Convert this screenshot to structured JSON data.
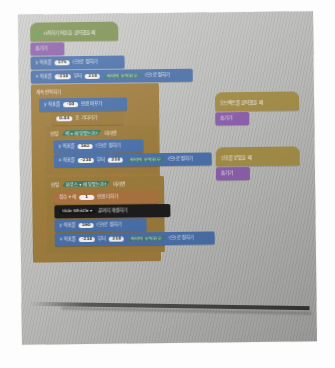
{
  "scene": {
    "description": "photo-of-screen",
    "app": "block-coding-editor",
    "colors": {
      "motion": "#4a6fa8",
      "look": "#8a5ea8",
      "event": "#a08a46",
      "control": "#9a7a3c",
      "sound": "#1d1d1d",
      "calc": "#4e8a72",
      "variable": "#a8713f",
      "start": "#7a8f4e",
      "screen_background": "#bdbdbb"
    }
  },
  "main_script": {
    "name": "main-stack",
    "blocks": [
      {
        "id": "b0",
        "kind": "hat",
        "category": "start",
        "icon": "green-flag-icon",
        "text": "시작하기 버튼을 클릭했을 때"
      },
      {
        "id": "b1",
        "kind": "stack",
        "category": "look",
        "text": "숨기기"
      },
      {
        "id": "b2",
        "kind": "stack",
        "category": "motion",
        "pre": "y 좌표를",
        "value": "175",
        "post": "(으)로 정하기"
      },
      {
        "id": "b3",
        "kind": "stack",
        "category": "motion",
        "pre": "x 좌표를",
        "value1": "-210",
        "mid": "부터",
        "value2": "210",
        "hex": "사이의 무작위 수",
        "post": "(으)로 정하기"
      },
      {
        "id": "b4",
        "kind": "c-head",
        "category": "control",
        "text": "계속 반복하기"
      },
      {
        "id": "b5",
        "kind": "stack",
        "category": "motion",
        "pre": "y 좌표를",
        "value": "-10",
        "post": "만큼 바꾸기"
      },
      {
        "id": "b6",
        "kind": "stack",
        "category": "control",
        "value": "0.03",
        "post": "초 기다리기"
      },
      {
        "id": "b7",
        "kind": "c-head",
        "category": "control",
        "pre": "만일",
        "hex": "벽 ▾ 에 닿았는가?",
        "post": "이라면"
      },
      {
        "id": "b8",
        "kind": "stack",
        "category": "motion",
        "pre": "y 좌표를",
        "value": "162",
        "post": "(으)로 정하기"
      },
      {
        "id": "b9",
        "kind": "stack",
        "category": "motion",
        "pre": "x 좌표를",
        "value1": "-210",
        "mid": "부터",
        "value2": "210",
        "hex": "사이의 무작위 수",
        "post": "(으)로 정하기"
      },
      {
        "id": "b10",
        "kind": "c-head",
        "category": "control",
        "pre": "만일",
        "hex": "마우스 ▾ 에 닿았는가?",
        "post": "이라면"
      },
      {
        "id": "b11",
        "kind": "stack",
        "category": "variable",
        "pre": "점수 ▾ 에",
        "value": "1",
        "post": "만큼 더하기"
      },
      {
        "id": "b12",
        "kind": "stack",
        "category": "sound",
        "dropdown": "Hide Whistle ▾",
        "post": "끝까지 재생하기"
      },
      {
        "id": "b13",
        "kind": "stack",
        "category": "motion",
        "pre": "y 좌표를",
        "value": "190",
        "post": "(으)로 정하기"
      },
      {
        "id": "b14",
        "kind": "stack",
        "category": "motion",
        "pre": "x 좌표를",
        "value1": "-210",
        "mid": "부터",
        "value2": "210",
        "hex": "사이의 무작위 수",
        "post": "(으)로 정하기"
      }
    ]
  },
  "side_scripts": [
    {
      "name": "side-script-1",
      "hat": "오브젝트를 클릭했을 때",
      "blocks": [
        {
          "text": "숨기기",
          "category": "look"
        }
      ]
    },
    {
      "name": "side-script-2",
      "hat": "신호를 받았을 때",
      "blocks": [
        {
          "text": "숨기기",
          "category": "look"
        }
      ]
    }
  ]
}
